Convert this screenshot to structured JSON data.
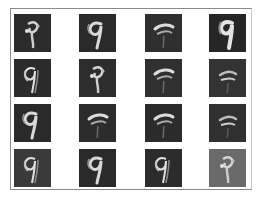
{
  "figure": {
    "rows": 4,
    "cols": 4,
    "tiles": [
      {
        "row": 0,
        "col": 0,
        "bg": "#2c2c2c",
        "style": "blob"
      },
      {
        "row": 0,
        "col": 1,
        "bg": "#2a2a2a",
        "style": "nine"
      },
      {
        "row": 0,
        "col": 2,
        "bg": "#2f2f2f",
        "style": "stroke-top"
      },
      {
        "row": 0,
        "col": 3,
        "bg": "#262626",
        "style": "nine-bold"
      },
      {
        "row": 1,
        "col": 0,
        "bg": "#2b2b2b",
        "style": "nine-outline"
      },
      {
        "row": 1,
        "col": 1,
        "bg": "#2d2d2d",
        "style": "blob"
      },
      {
        "row": 1,
        "col": 2,
        "bg": "#303030",
        "style": "stroke-top"
      },
      {
        "row": 1,
        "col": 3,
        "bg": "#333333",
        "style": "stroke-top-faint"
      },
      {
        "row": 2,
        "col": 0,
        "bg": "#2a2a2a",
        "style": "nine"
      },
      {
        "row": 2,
        "col": 1,
        "bg": "#2c2c2c",
        "style": "stroke-top"
      },
      {
        "row": 2,
        "col": 2,
        "bg": "#2b2b2b",
        "style": "stroke-top"
      },
      {
        "row": 2,
        "col": 3,
        "bg": "#303030",
        "style": "stroke-top-faint"
      },
      {
        "row": 3,
        "col": 0,
        "bg": "#3a3a3a",
        "style": "nine-outline"
      },
      {
        "row": 3,
        "col": 1,
        "bg": "#2a2a2a",
        "style": "nine"
      },
      {
        "row": 3,
        "col": 2,
        "bg": "#2c2c2c",
        "style": "nine-outline"
      },
      {
        "row": 3,
        "col": 3,
        "bg": "#6a6a6a",
        "style": "blob"
      }
    ]
  }
}
